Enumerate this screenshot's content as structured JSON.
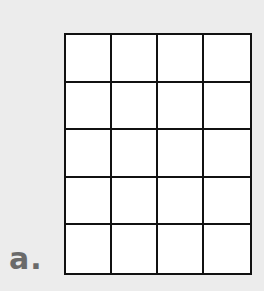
{
  "label": "a.",
  "grid": {
    "rows": 5,
    "columns": 4,
    "cells_filled": 0,
    "line_color": "#111111",
    "cell_color": "#ffffff"
  },
  "background_color": "#ececec"
}
